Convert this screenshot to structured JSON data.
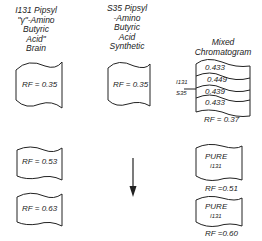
{
  "columns": [
    {
      "heading": [
        "I131 Pipsyl",
        "\"γ\"-Amino",
        "Butyric",
        "Acid\"",
        "Brain"
      ],
      "spots": [
        "RF = 0.35",
        "RF = 0.53",
        "RF = 0.63"
      ]
    },
    {
      "heading": [
        "S35 Pipsyl",
        "-Amino",
        "Butyric",
        "Acid",
        "Synthetic"
      ],
      "spots": [
        "RF = 0.35"
      ]
    },
    {
      "heading": [
        "Mixed",
        "Chromatogram"
      ],
      "isotope_labels": [
        "I131",
        "S35"
      ],
      "bands": [
        "0.433",
        "0.449",
        "0.439",
        "0.433"
      ],
      "mixed_rf": "RF = 0.37",
      "pure_spots": [
        {
          "label": "PURE",
          "isotope": "I131",
          "rf": "RF =0.51"
        },
        {
          "label": "PURE",
          "isotope": "I131",
          "rf": "RF =0.60"
        }
      ]
    }
  ],
  "arrow": "down-arrow"
}
